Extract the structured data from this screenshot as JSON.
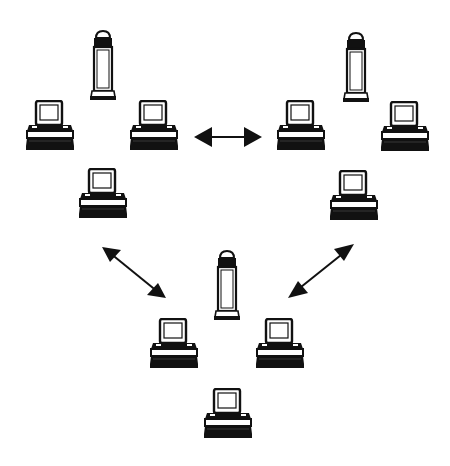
{
  "diagram": {
    "colors": {
      "ink": "#111111",
      "background": "#ffffff"
    },
    "groups": [
      {
        "id": "top-left",
        "tower": {
          "x": 90,
          "y": 30
        },
        "computers": [
          {
            "x": 26,
            "y": 100
          },
          {
            "x": 130,
            "y": 100
          },
          {
            "x": 79,
            "y": 168
          }
        ]
      },
      {
        "id": "top-right",
        "tower": {
          "x": 343,
          "y": 32
        },
        "computers": [
          {
            "x": 277,
            "y": 100
          },
          {
            "x": 381,
            "y": 101
          },
          {
            "x": 330,
            "y": 170
          }
        ]
      },
      {
        "id": "bottom",
        "tower": {
          "x": 214,
          "y": 250
        },
        "computers": [
          {
            "x": 150,
            "y": 318
          },
          {
            "x": 256,
            "y": 318
          },
          {
            "x": 204,
            "y": 388
          }
        ]
      }
    ],
    "arrows": [
      {
        "id": "top-left-to-top-right",
        "x1": 195,
        "y1": 137,
        "x2": 261,
        "y2": 137
      },
      {
        "id": "top-left-to-bottom",
        "x1": 102,
        "y1": 247,
        "x2": 166,
        "y2": 298
      },
      {
        "id": "top-right-to-bottom",
        "x1": 354,
        "y1": 244,
        "x2": 288,
        "y2": 298
      }
    ]
  }
}
